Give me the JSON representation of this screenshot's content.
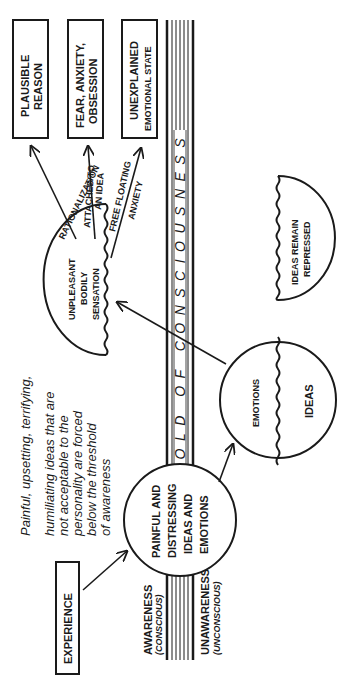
{
  "diagram": {
    "orientation": "rotated 90deg counter-clockwise (read with page turned)",
    "colors": {
      "ink": "#1a1a1a",
      "background": "#ffffff"
    },
    "threshold": {
      "label": "THRESHOLD OF CONSCIOUSNESS",
      "above_label": "AWARENESS",
      "above_sublabel": "(CONSCIOUS)",
      "below_label": "UNAWARENESS",
      "below_sublabel": "(UNCONSCIOUS)"
    },
    "experience_box": {
      "label": "EXPERIENCE"
    },
    "painful_circle": {
      "lines": [
        "PAINFUL AND",
        "DISTRESSING",
        "IDEAS AND",
        "EMOTIONS"
      ]
    },
    "annotation": {
      "lines": [
        "Painful, upsetting, terrifying,",
        "humiliating ideas that are",
        "not acceptable to the",
        "personality are forced",
        "below the threshold",
        "of awareness"
      ]
    },
    "split_circle": {
      "upper_label": "EMOTIONS",
      "lower_label": "IDEAS"
    },
    "bodily_sensation": {
      "lines": [
        "UNPLEASANT",
        "BODILY",
        "SENSATION"
      ]
    },
    "repressed": {
      "lines": [
        "IDEAS REMAIN",
        "REPRESSED"
      ]
    },
    "pathways": [
      {
        "arrow_label": "RATIONALIZATION",
        "arrow_label_lines": [
          "RATIONALIZATION"
        ],
        "outcome_lines": [
          "PLAUSIBLE",
          "REASON"
        ]
      },
      {
        "arrow_label": "ATTACHED TO AN IDEA",
        "arrow_label_lines": [
          "ATTACHED TO",
          "AN IDEA"
        ],
        "outcome_lines": [
          "FEAR, ANXIETY,",
          "OBSESSION"
        ]
      },
      {
        "arrow_label": "FREE FLOATING ANXIETY",
        "arrow_label_lines": [
          "FREE FLOATING",
          "ANXIETY"
        ],
        "outcome_lines": [
          "UNEXPLAINED",
          "EMOTIONAL STATE"
        ]
      }
    ]
  }
}
